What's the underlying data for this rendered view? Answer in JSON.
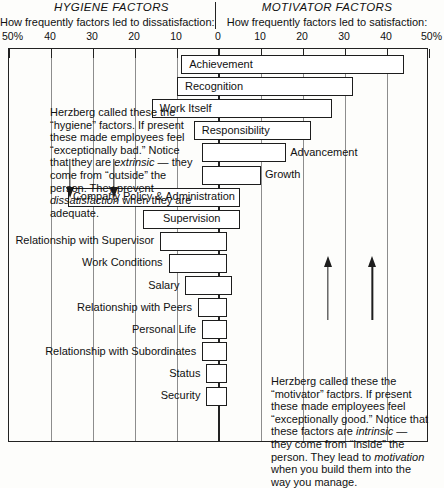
{
  "header": {
    "hygiene_title": "HYGIENE FACTORS",
    "hygiene_subtitle": "How frequently factors led to dissatisfaction:",
    "motivator_title": "MOTIVATOR FACTORS",
    "motivator_subtitle": "How frequently factors led to satisfaction:"
  },
  "notes": {
    "hygiene": "Herzberg called these the “hygiene” factors. If present these made employees feel “exceptionally bad.” Notice that they are extrinsic — they come from “outside” the person. They prevent dissatisfaction when they are adequate.",
    "motivator": "Herzberg called these the “motivator” factors. If present these made employees feel “exceptionally good.” Notice that these factors are intrinsic — they come from “inside” the person. They lead to motivation when you build them into the way you manage."
  },
  "axis": {
    "ticks": [
      {
        "label": "50%",
        "value": -50
      },
      {
        "label": "40",
        "value": -40
      },
      {
        "label": "30",
        "value": -30
      },
      {
        "label": "20",
        "value": -20
      },
      {
        "label": "10",
        "value": -10
      },
      {
        "label": "0",
        "value": 0
      },
      {
        "label": "10",
        "value": 10
      },
      {
        "label": "20",
        "value": 20
      },
      {
        "label": "30",
        "value": 30
      },
      {
        "label": "40",
        "value": 40
      },
      {
        "label": "50%",
        "value": 50
      }
    ],
    "min": -50,
    "max": 50,
    "unit": "%"
  },
  "chart_data": {
    "type": "bar",
    "orientation": "horizontal",
    "xlabel": "How frequently factors led to dissatisfaction / satisfaction (%)",
    "ylabel": "",
    "xlim": [
      -50,
      50
    ],
    "grid": true,
    "legend": false,
    "note": "Negative values = dissatisfaction (hygiene side, left); positive values = satisfaction (motivator side, right). Each bar spans from its dissatisfaction extent to its satisfaction extent.",
    "categories": [
      "Achievement",
      "Recognition",
      "Work Itself",
      "Responsibility",
      "Advancement",
      "Growth",
      "Company Policy & Administration",
      "Supervision",
      "Relationship with Supervisor",
      "Work Conditions",
      "Salary",
      "Relationship with Peers",
      "Personal Life",
      "Relationship with Subordinates",
      "Status",
      "Security"
    ],
    "series": [
      {
        "name": "Dissatisfaction (hygiene, %)",
        "values": [
          9,
          10,
          16,
          6,
          4,
          4,
          36,
          18,
          14,
          12,
          8,
          5,
          4,
          4,
          3,
          3
        ]
      },
      {
        "name": "Satisfaction (motivator, %)",
        "values": [
          44,
          32,
          27,
          22,
          16,
          10,
          5,
          5,
          2,
          2,
          3,
          2,
          2,
          2,
          2,
          2
        ]
      }
    ],
    "bars": [
      {
        "label": "Achievement",
        "start": -9,
        "end": 44,
        "label_pos": "inside"
      },
      {
        "label": "Recognition",
        "start": -10,
        "end": 32,
        "label_pos": "inside"
      },
      {
        "label": "Work Itself",
        "start": -16,
        "end": 27,
        "label_pos": "inside"
      },
      {
        "label": "Responsibility",
        "start": -6,
        "end": 22,
        "label_pos": "inside"
      },
      {
        "label": "Advancement",
        "start": -4,
        "end": 16,
        "label_pos": "right"
      },
      {
        "label": "Growth",
        "start": -4,
        "end": 10,
        "label_pos": "right"
      },
      {
        "label": "Company Policy & Administration",
        "start": -36,
        "end": 5,
        "label_pos": "inside"
      },
      {
        "label": "Supervision",
        "start": -18,
        "end": 5,
        "label_pos": "inside"
      },
      {
        "label": "Relationship with Supervisor",
        "start": -14,
        "end": 2,
        "label_pos": "left"
      },
      {
        "label": "Work Conditions",
        "start": -12,
        "end": 2,
        "label_pos": "left"
      },
      {
        "label": "Salary",
        "start": -8,
        "end": 3,
        "label_pos": "left"
      },
      {
        "label": "Relationship with Peers",
        "start": -5,
        "end": 2,
        "label_pos": "left"
      },
      {
        "label": "Personal Life",
        "start": -4,
        "end": 2,
        "label_pos": "left"
      },
      {
        "label": "Relationship with Subordinates",
        "start": -4,
        "end": 2,
        "label_pos": "left"
      },
      {
        "label": "Status",
        "start": -3,
        "end": 2,
        "label_pos": "left"
      },
      {
        "label": "Security",
        "start": -3,
        "end": 2,
        "label_pos": "left"
      }
    ]
  },
  "arrows": [
    {
      "direction": "down",
      "x_value": -35.5,
      "y_top": 158,
      "y_bottom": 197
    },
    {
      "direction": "down",
      "x_value": -25,
      "y_top": 158,
      "y_bottom": 197
    },
    {
      "direction": "up",
      "x_value": 26,
      "y_top": 255,
      "y_bottom": 319
    },
    {
      "direction": "up",
      "x_value": 36.5,
      "y_top": 255,
      "y_bottom": 319
    }
  ],
  "colors": {
    "background": "#fdfdfb",
    "ink": "#111111",
    "bar_border": "#1d1d1d",
    "bar_fill": "#ffffff",
    "gridline": "#8d8d8d",
    "frame": "#222222"
  }
}
